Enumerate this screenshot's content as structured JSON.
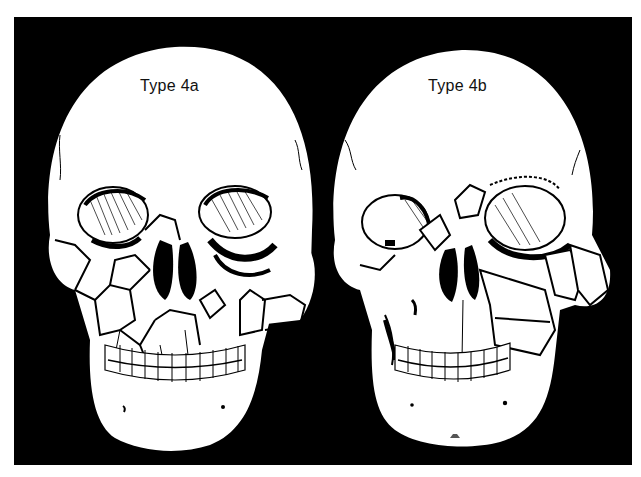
{
  "figure": {
    "background_color": "#000000",
    "bone_color": "#ffffff",
    "line_color": "#000000",
    "panels": [
      {
        "id": "left",
        "label": "Type 4a",
        "description": "Frontal skull with comminuted fractures across right midface/orbit and left zygoma"
      },
      {
        "id": "right",
        "label": "Type 4b",
        "description": "Frontal skull with displaced fragments of left orbit, zygoma and maxilla"
      }
    ]
  }
}
